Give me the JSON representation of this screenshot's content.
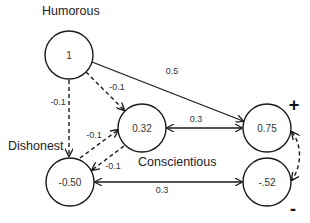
{
  "diagram": {
    "labels": {
      "humorous": "Humorous",
      "dishonest": "Dishonest",
      "conscientious": "Conscientious",
      "plus": "+",
      "minus": "-"
    },
    "nodes": [
      {
        "id": "humorous",
        "value": "1",
        "cx": 69,
        "cy": 55,
        "r": 24
      },
      {
        "id": "conscientious-pos",
        "value": "0.32",
        "cx": 142,
        "cy": 128,
        "r": 24
      },
      {
        "id": "plus-node",
        "value": "0.75",
        "cx": 267,
        "cy": 128,
        "r": 24
      },
      {
        "id": "dishonest",
        "value": "-0.50",
        "cx": 70,
        "cy": 182,
        "r": 24
      },
      {
        "id": "minus-node",
        "value": "-.52",
        "cx": 267,
        "cy": 182,
        "r": 24
      }
    ],
    "edges": [
      {
        "from": "humorous",
        "to": "plus-node",
        "label": "0.5",
        "style": "solid",
        "direction": "forward"
      },
      {
        "from": "humorous",
        "to": "conscientious-pos",
        "label": "-0.1",
        "style": "dashed",
        "direction": "forward"
      },
      {
        "from": "humorous",
        "to": "dishonest",
        "label": "-0.1",
        "style": "dashed",
        "direction": "forward"
      },
      {
        "from": "dishonest",
        "to": "conscientious-pos",
        "label": "-0.1",
        "style": "dashed",
        "direction": "forward"
      },
      {
        "from": "conscientious-pos",
        "to": "dishonest",
        "label": "-0.1",
        "style": "dashed",
        "direction": "forward"
      },
      {
        "from": "conscientious-pos",
        "to": "plus-node",
        "label": "0.3",
        "style": "solid",
        "direction": "both"
      },
      {
        "from": "dishonest",
        "to": "minus-node",
        "label": "0.3",
        "style": "solid",
        "direction": "both"
      },
      {
        "from": "plus-node",
        "to": "minus-node",
        "label": "",
        "style": "dashed",
        "direction": "both"
      }
    ]
  }
}
